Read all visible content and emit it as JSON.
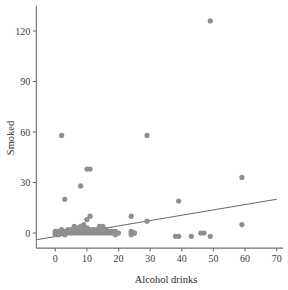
{
  "chart_data": {
    "type": "scatter",
    "title": "",
    "xlabel": "Alcohol drinks",
    "ylabel": "Smoked",
    "xlim": [
      -6,
      72
    ],
    "ylim": [
      -9,
      135
    ],
    "xticks": [
      0,
      10,
      20,
      30,
      40,
      50,
      60,
      70
    ],
    "xtick_labels": [
      "0",
      "10",
      "20",
      "30",
      "40",
      "50",
      "60",
      "70"
    ],
    "yticks": [
      0,
      30,
      60,
      90,
      120
    ],
    "ytick_labels": [
      "0",
      "30",
      "60",
      "90",
      "120"
    ],
    "grid": false,
    "legend": null,
    "point_color": "#8f8f8f",
    "point_radius": 2.6,
    "line_color": "#6b6b6b",
    "axis_color": "#6e6e6e",
    "series": [
      {
        "name": "Respondents",
        "marker": "circle",
        "x": [
          2,
          3,
          8,
          10,
          11,
          29,
          49,
          59,
          39,
          24,
          29,
          10,
          11,
          14,
          9,
          16,
          24,
          25,
          38,
          39,
          43,
          46,
          47,
          49,
          59,
          0,
          0,
          0,
          0,
          1,
          1,
          1,
          1,
          2,
          2,
          2,
          3,
          3,
          3,
          4,
          4,
          4,
          5,
          5,
          5,
          6,
          6,
          6,
          7,
          7,
          7,
          8,
          8,
          8,
          9,
          9,
          9,
          10,
          10,
          10,
          11,
          11,
          12,
          12,
          12,
          13,
          13,
          14,
          14,
          14,
          15,
          15,
          16,
          16,
          16,
          17,
          17,
          18,
          18,
          19,
          19,
          19,
          20,
          24,
          24,
          25,
          6,
          9,
          13,
          15
        ],
        "y": [
          58,
          20,
          28,
          38,
          38,
          58,
          126,
          33,
          19,
          10,
          7,
          8,
          10,
          4,
          5,
          2,
          1,
          0,
          -2,
          -2,
          -2,
          0,
          0,
          -2,
          5,
          0,
          0,
          -1,
          1,
          0,
          0,
          1,
          -1,
          0,
          1,
          2,
          0,
          1,
          -1,
          0,
          1,
          2,
          0,
          1,
          2,
          0,
          1,
          3,
          0,
          2,
          3,
          0,
          1,
          4,
          0,
          1,
          2,
          0,
          1,
          3,
          0,
          2,
          0,
          1,
          2,
          0,
          1,
          0,
          1,
          3,
          0,
          1,
          0,
          1,
          2,
          0,
          1,
          0,
          1,
          0,
          1,
          -1,
          0,
          0,
          -1,
          0,
          4,
          3,
          2,
          4
        ]
      }
    ],
    "fit_line": {
      "name": "least-squares fit",
      "x_start": -6,
      "y_start": -4,
      "x_end": 70,
      "y_end": 20
    }
  },
  "axis_labels": {
    "x_title": "Alcohol drinks",
    "y_title": "Smoked"
  }
}
